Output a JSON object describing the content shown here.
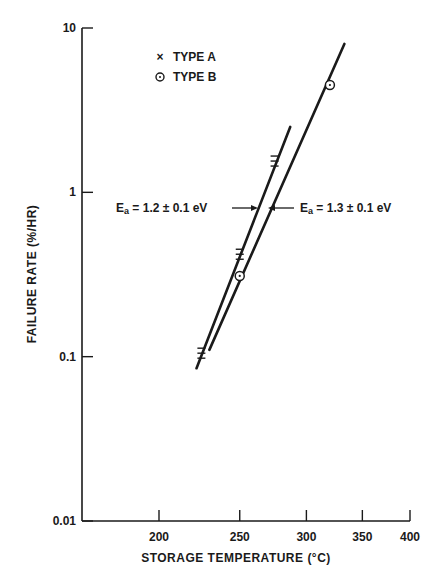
{
  "chart_data": {
    "type": "line",
    "title": "",
    "xlabel": "STORAGE TEMPERATURE (°C)",
    "ylabel": "FAILURE RATE (%/HR)",
    "x_scale": "reciprocal-absolute-temperature (Arrhenius)",
    "y_scale": "log",
    "xlim": [
      150,
      400
    ],
    "ylim": [
      0.01,
      10
    ],
    "x_ticks": [
      200,
      250,
      300,
      350,
      400
    ],
    "y_ticks": [
      10,
      1,
      0.1,
      0.01
    ],
    "y_tick_labels": [
      "10",
      "1",
      "0.1",
      "0.01"
    ],
    "x_tick_labels": [
      "200",
      "250",
      "300",
      "350",
      "400"
    ],
    "grid": false,
    "legend": [
      {
        "marker": "×",
        "label": "TYPE A"
      },
      {
        "marker": "⊙",
        "label": "TYPE B"
      }
    ],
    "legend_position": "upper-left",
    "series": [
      {
        "name": "TYPE A",
        "marker": "x",
        "points": [
          {
            "x": 225,
            "y": 0.105
          },
          {
            "x": 250,
            "y": 0.42
          },
          {
            "x": 275,
            "y": 1.55
          }
        ],
        "fit_line": {
          "from": {
            "x": 222,
            "y": 0.085
          },
          "to": {
            "x": 287,
            "y": 2.5
          }
        },
        "activation_energy": "Ea = 1.2 ± 0.1 eV"
      },
      {
        "name": "TYPE B",
        "marker": "circle-dot",
        "points": [
          {
            "x": 250,
            "y": 0.31
          },
          {
            "x": 320,
            "y": 4.5
          }
        ],
        "fit_line": {
          "from": {
            "x": 230,
            "y": 0.11
          },
          "to": {
            "x": 333,
            "y": 8.0
          }
        },
        "activation_energy": "Ea = 1.3 ± 0.1 eV"
      }
    ],
    "annotations": [
      {
        "text_main": "E",
        "text_sub": "a",
        "text_rest": " = 1.2 ± 0.1 eV",
        "points_to": "TYPE A",
        "arrow": "right"
      },
      {
        "text_main": "E",
        "text_sub": "a",
        "text_rest": " = 1.3 ± 0.1 eV",
        "points_to": "TYPE B",
        "arrow": "left"
      }
    ]
  }
}
